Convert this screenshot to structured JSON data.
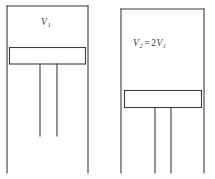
{
  "figure": {
    "background_color": "#fefefe",
    "stroke_color": "#3d3d3d",
    "stroke_width": 1,
    "text_color": "#3a3a3a",
    "cylinders": [
      {
        "id": "left-cylinder",
        "name": "cylinder-left",
        "label": {
          "symbol": "V",
          "subscript": "1",
          "full_text": "V1",
          "x": 41,
          "y": 18
        },
        "walls": {
          "left_x": 7,
          "right_x": 88,
          "top_y": 6,
          "bottom_y": 173
        },
        "piston": {
          "x": 9,
          "y": 47,
          "width": 77,
          "height": 17
        },
        "rods": [
          {
            "x": 40,
            "y_top": 64,
            "y_bottom": 136
          },
          {
            "x": 57,
            "y_top": 64,
            "y_bottom": 136
          }
        ]
      },
      {
        "id": "right-cylinder",
        "name": "cylinder-right",
        "label": {
          "symbol": "V",
          "subscript": "2",
          "equals": "=",
          "coefficient": "2",
          "symbol2": "V",
          "subscript2": "1",
          "full_text": "V2 = 2V1",
          "x": 133,
          "y": 39
        },
        "walls": {
          "left_x": 121,
          "right_x": 204,
          "top_y": 9,
          "bottom_y": 173
        },
        "piston": {
          "x": 124,
          "y": 90,
          "width": 78,
          "height": 18
        },
        "rods": [
          {
            "x": 155,
            "y_top": 108,
            "y_bottom": 173
          },
          {
            "x": 171,
            "y_top": 108,
            "y_bottom": 173
          }
        ]
      }
    ]
  }
}
